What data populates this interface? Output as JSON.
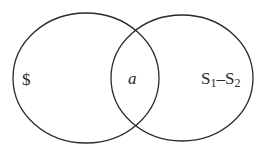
{
  "diagram": {
    "type": "venn",
    "stroke_color": "#2a2a2a",
    "sets": [
      {
        "id": "left",
        "label": "$"
      },
      {
        "id": "right",
        "label_main": "S",
        "sub1": "1",
        "minus": "–",
        "label_main2": "S",
        "sub2": "2"
      }
    ],
    "intersection_label": "a"
  }
}
